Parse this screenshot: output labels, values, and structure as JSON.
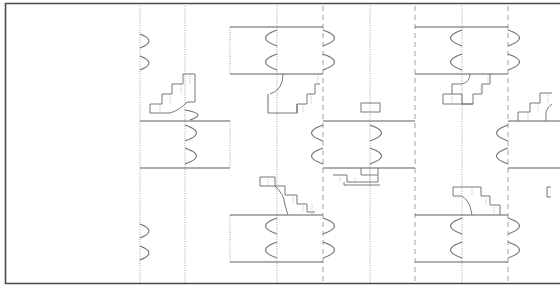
{
  "drawing": {
    "type": "architectural-floor-plan",
    "description": "Repeating modular floor plan with room modules, paired door swings, staircases, dotted grid lines and dashed axis lines",
    "colors": {
      "background": "#ffffff",
      "frame": "#4a4a4a",
      "walls": "#5e5e5e",
      "grid": "#8a8a8a",
      "doors": "#707070"
    },
    "frame": {
      "left": 5,
      "top": 3,
      "bottom": 284,
      "right_open": true
    },
    "grid_dotted_x": [
      140,
      185,
      277,
      370,
      462
    ],
    "grid_dashed_x": [
      323,
      415,
      508
    ],
    "rooms": [
      {
        "id": "room-1",
        "x1": 230,
        "x2": 323,
        "y1": 27,
        "y2": 74
      },
      {
        "id": "room-2",
        "x1": 140,
        "x2": 230,
        "y1": 121,
        "y2": 168
      },
      {
        "id": "room-3",
        "x1": 323,
        "x2": 415,
        "y1": 121,
        "y2": 168
      },
      {
        "id": "room-4",
        "x1": 415,
        "x2": 508,
        "y1": 27,
        "y2": 74
      },
      {
        "id": "room-5",
        "x1": 508,
        "x2": 560,
        "y1": 121,
        "y2": 168
      },
      {
        "id": "room-6",
        "x1": 230,
        "x2": 323,
        "y1": 215,
        "y2": 262
      },
      {
        "id": "room-7",
        "x1": 415,
        "x2": 508,
        "y1": 215,
        "y2": 262
      }
    ],
    "staircases": 6,
    "text_labels": []
  }
}
